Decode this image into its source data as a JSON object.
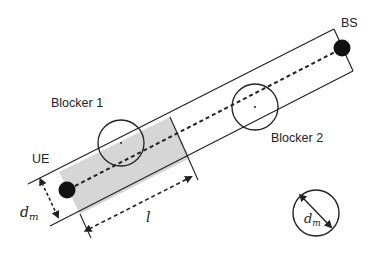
{
  "diagram": {
    "labels": {
      "bs": "BS",
      "ue": "UE",
      "blocker1": "Blocker 1",
      "blocker2": "Blocker 2",
      "length": "l",
      "dm_main": "d",
      "dm_main_sub": "m",
      "dm_legend": "d",
      "dm_legend_sub": "m"
    },
    "colors": {
      "stroke": "#222222",
      "shade": "#d6d6d6",
      "node": "#111111",
      "background": "#ffffff"
    },
    "nodes": [
      {
        "id": "ue",
        "label": "UE",
        "cx": 67,
        "cy": 190,
        "r": 8
      },
      {
        "id": "bs",
        "label": "BS",
        "cx": 342,
        "cy": 48,
        "r": 8
      }
    ],
    "blockers": [
      {
        "id": "blocker1",
        "label": "Blocker 1",
        "cx": 121,
        "cy": 143,
        "r": 23
      },
      {
        "id": "blocker2",
        "label": "Blocker 2",
        "cx": 255,
        "cy": 107,
        "r": 23
      }
    ],
    "legend_circle": {
      "cx": 316,
      "cy": 213,
      "r": 23,
      "label": "d_m"
    }
  }
}
